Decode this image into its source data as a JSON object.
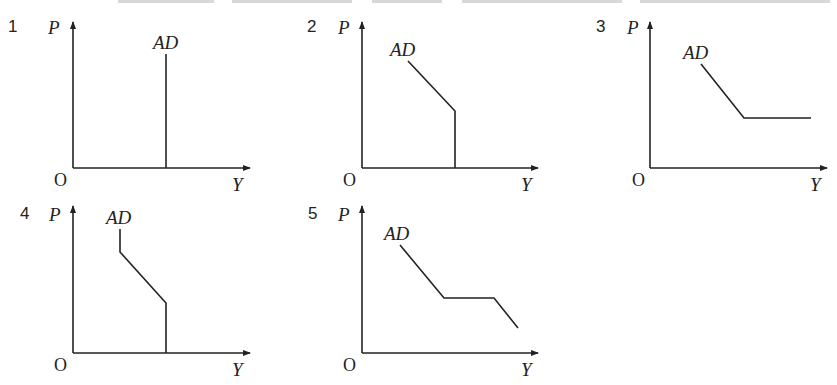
{
  "figure": {
    "panels": [
      {
        "number": "1",
        "y_axis_label": "P",
        "x_axis_label": "Y",
        "origin_label": "O",
        "curve_label": "AD",
        "description": "Vertical AD curve"
      },
      {
        "number": "2",
        "y_axis_label": "P",
        "x_axis_label": "Y",
        "origin_label": "O",
        "curve_label": "AD",
        "description": "Downward-sloping AD, then vertical segment at lower prices"
      },
      {
        "number": "3",
        "y_axis_label": "P",
        "x_axis_label": "Y",
        "origin_label": "O",
        "curve_label": "AD",
        "description": "Downward-sloping AD, then horizontal segment"
      },
      {
        "number": "4",
        "y_axis_label": "P",
        "x_axis_label": "Y",
        "origin_label": "O",
        "curve_label": "AD",
        "description": "Short vertical segment, downward-sloping middle, vertical segment at lower prices"
      },
      {
        "number": "5",
        "y_axis_label": "P",
        "x_axis_label": "Y",
        "origin_label": "O",
        "curve_label": "AD",
        "description": "Downward-sloping, horizontal segment, then downward-sloping again"
      }
    ]
  },
  "colors": {
    "ink": "#222222",
    "background": "#ffffff"
  }
}
